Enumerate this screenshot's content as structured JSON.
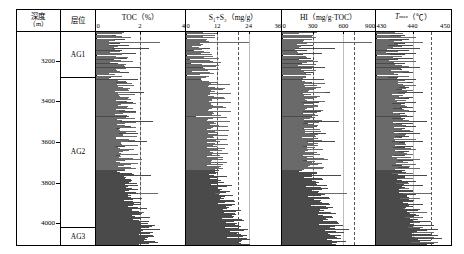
{
  "figure": {
    "title_visible": false,
    "depth_header": {
      "line1": "深度",
      "line2": "（m）"
    },
    "strata_header": "层位",
    "depth_axis": {
      "label_unit": "m",
      "min": 3060,
      "max": 4110,
      "ticks": [
        3200,
        3400,
        3600,
        3800,
        4000
      ],
      "tick_labels": [
        "3200",
        "3400",
        "3600",
        "3800",
        "4000"
      ]
    },
    "strata": [
      {
        "name": "AG1",
        "top": 3060,
        "base": 3280
      },
      {
        "name": "AG2",
        "top": 3280,
        "base": 4018
      },
      {
        "name": "AG3",
        "top": 4018,
        "base": 4110
      }
    ]
  },
  "chart_data": {
    "type": "bar",
    "orientation": "horizontal-spike-log",
    "title": "",
    "ylabel": "深度（m）",
    "ylim": [
      4110,
      3060
    ],
    "grid": false,
    "legend": "none",
    "tracks": [
      {
        "name": "toc",
        "title": "TOC（%）",
        "unit": "%",
        "xlabel": "TOC（%）",
        "xlim": [
          0,
          4
        ],
        "ticks": [
          0,
          2,
          4
        ],
        "tick_labels": [
          "0",
          "2",
          "4"
        ],
        "reference_lines": [
          2.0
        ],
        "depths": [
          3075,
          3085,
          3092,
          3100,
          3108,
          3115,
          3122,
          3130,
          3138,
          3146,
          3154,
          3162,
          3170,
          3178,
          3186,
          3194,
          3202,
          3210,
          3218,
          3226,
          3234,
          3242,
          3250,
          3258,
          3266,
          3274,
          3282,
          3290,
          3298,
          3306,
          3314,
          3322,
          3330,
          3338,
          3346,
          3354,
          3362,
          3370,
          3378,
          3386,
          3394,
          3402,
          3410,
          3418,
          3426,
          3434,
          3442,
          3450,
          3458,
          3466,
          3474,
          3482,
          3490,
          3498,
          3506,
          3514,
          3522,
          3530,
          3538,
          3546,
          3554,
          3562,
          3570,
          3578,
          3586,
          3594,
          3602,
          3610,
          3618,
          3626,
          3634,
          3642,
          3650,
          3658,
          3666,
          3674,
          3682,
          3690,
          3698,
          3706,
          3714,
          3722,
          3730,
          3738,
          3746,
          3754,
          3762,
          3770,
          3778,
          3786,
          3794,
          3802,
          3810,
          3818,
          3826,
          3834,
          3842,
          3850,
          3858,
          3866,
          3874,
          3882,
          3890,
          3898,
          3906,
          3914,
          3922,
          3930,
          3938,
          3946,
          3954,
          3962,
          3970,
          3978,
          3986,
          3994,
          4002,
          4010,
          4018,
          4026,
          4034,
          4042,
          4050,
          4058,
          4066,
          4074,
          4082,
          4090,
          4098
        ],
        "values": [
          0.9,
          1.6,
          1.3,
          0.8,
          2.9,
          1.1,
          1.5,
          1.0,
          2.4,
          1.2,
          0.7,
          1.8,
          1.1,
          0.9,
          1.4,
          0.8,
          1.7,
          1.0,
          0.6,
          1.3,
          2.0,
          0.9,
          1.1,
          1.5,
          0.8,
          1.2,
          0.7,
          1.9,
          1.0,
          1.4,
          0.9,
          1.6,
          1.1,
          0.8,
          1.3,
          2.2,
          1.0,
          0.9,
          1.5,
          1.2,
          0.8,
          1.7,
          1.1,
          1.0,
          1.4,
          0.9,
          1.3,
          1.8,
          1.1,
          0.8,
          1.5,
          1.0,
          1.2,
          2.6,
          1.3,
          0.9,
          1.6,
          1.1,
          0.8,
          1.4,
          1.9,
          1.0,
          1.2,
          0.9,
          1.5,
          2.3,
          1.1,
          0.8,
          1.3,
          1.0,
          1.7,
          1.2,
          0.9,
          1.4,
          1.1,
          0.8,
          2.1,
          1.3,
          1.0,
          1.6,
          0.9,
          1.2,
          1.8,
          1.1,
          0.8,
          1.4,
          2.5,
          1.0,
          1.3,
          0.9,
          1.6,
          1.1,
          1.9,
          0.8,
          1.2,
          1.5,
          1.0,
          2.8,
          1.3,
          0.9,
          1.7,
          1.1,
          1.4,
          0.8,
          2.0,
          1.2,
          1.0,
          1.6,
          0.9,
          2.2,
          1.3,
          1.1,
          1.8,
          1.0,
          2.4,
          1.4,
          1.2,
          2.7,
          1.5,
          2.9,
          1.6,
          2.3,
          1.7,
          2.6,
          1.8,
          2.1,
          1.5,
          2.0,
          1.4
        ]
      },
      {
        "name": "s1_s2",
        "title": "S₁+S₂（mg/g）",
        "unit": "mg/g",
        "xlabel": "S₁+S₂（mg/g）",
        "xlim": [
          0,
          36
        ],
        "ticks": [
          0,
          12,
          24,
          36
        ],
        "tick_labels": [
          "0",
          "12",
          "24",
          "36"
        ],
        "reference_lines": [
          12,
          20
        ],
        "depths": [
          3075,
          3085,
          3092,
          3100,
          3108,
          3115,
          3122,
          3130,
          3138,
          3146,
          3154,
          3162,
          3170,
          3178,
          3186,
          3194,
          3202,
          3210,
          3218,
          3226,
          3234,
          3242,
          3250,
          3258,
          3266,
          3274,
          3282,
          3290,
          3298,
          3306,
          3314,
          3322,
          3330,
          3338,
          3346,
          3354,
          3362,
          3370,
          3378,
          3386,
          3394,
          3402,
          3410,
          3418,
          3426,
          3434,
          3442,
          3450,
          3458,
          3466,
          3474,
          3482,
          3490,
          3498,
          3506,
          3514,
          3522,
          3530,
          3538,
          3546,
          3554,
          3562,
          3570,
          3578,
          3586,
          3594,
          3602,
          3610,
          3618,
          3626,
          3634,
          3642,
          3650,
          3658,
          3666,
          3674,
          3682,
          3690,
          3698,
          3706,
          3714,
          3722,
          3730,
          3738,
          3746,
          3754,
          3762,
          3770,
          3778,
          3786,
          3794,
          3802,
          3810,
          3818,
          3826,
          3834,
          3842,
          3850,
          3858,
          3866,
          3874,
          3882,
          3890,
          3898,
          3906,
          3914,
          3922,
          3930,
          3938,
          3946,
          3954,
          3962,
          3970,
          3978,
          3986,
          3994,
          4002,
          4010,
          4018,
          4026,
          4034,
          4042,
          4050,
          4058,
          4066,
          4074,
          4082,
          4090,
          4098
        ],
        "values": [
          2.5,
          6.0,
          3.2,
          1.8,
          24.0,
          2.6,
          4.0,
          2.2,
          9.0,
          3.0,
          1.5,
          5.5,
          2.4,
          1.9,
          3.6,
          1.7,
          4.8,
          2.1,
          1.3,
          3.1,
          6.5,
          1.9,
          2.4,
          4.2,
          1.7,
          2.8,
          1.5,
          5.9,
          2.2,
          3.8,
          1.9,
          4.6,
          2.5,
          1.6,
          3.3,
          8.0,
          2.1,
          1.8,
          4.1,
          2.9,
          1.6,
          5.0,
          2.4,
          2.0,
          3.5,
          1.8,
          3.0,
          5.6,
          2.3,
          1.6,
          4.0,
          2.1,
          2.7,
          11.0,
          3.2,
          1.9,
          4.7,
          2.4,
          1.7,
          3.6,
          6.2,
          2.0,
          2.8,
          1.8,
          4.2,
          9.5,
          2.3,
          1.6,
          3.1,
          2.0,
          5.1,
          2.7,
          1.8,
          3.7,
          2.3,
          1.6,
          7.4,
          3.0,
          2.1,
          4.9,
          1.8,
          2.6,
          5.8,
          2.2,
          1.6,
          3.4,
          10.5,
          2.0,
          3.0,
          1.8,
          4.6,
          2.3,
          6.8,
          1.6,
          2.7,
          3.9,
          2.0,
          13.0,
          3.1,
          1.8,
          5.2,
          2.2,
          3.5,
          1.6,
          6.4,
          2.6,
          2.0,
          4.8,
          1.7,
          7.8,
          3.2,
          2.3,
          5.6,
          2.0,
          9.2,
          3.4,
          2.6,
          10.8,
          3.8,
          12.5,
          4.0,
          8.5,
          4.4,
          11.5,
          4.8,
          7.0,
          3.6,
          6.0,
          3.2
        ]
      },
      {
        "name": "hi",
        "title": "HI（mg/g·TOC）",
        "unit": "mg/g·TOC",
        "xlabel": "HI（mg/g·TOC）",
        "xlim": [
          0,
          900
        ],
        "ticks": [
          0,
          300,
          600,
          900
        ],
        "tick_labels": [
          "0",
          "300",
          "600",
          "900"
        ],
        "reference_lines": [
          300,
          700
        ],
        "depths": [
          3075,
          3085,
          3092,
          3100,
          3108,
          3115,
          3122,
          3130,
          3138,
          3146,
          3154,
          3162,
          3170,
          3178,
          3186,
          3194,
          3202,
          3210,
          3218,
          3226,
          3234,
          3242,
          3250,
          3258,
          3266,
          3274,
          3282,
          3290,
          3298,
          3306,
          3314,
          3322,
          3330,
          3338,
          3346,
          3354,
          3362,
          3370,
          3378,
          3386,
          3394,
          3402,
          3410,
          3418,
          3426,
          3434,
          3442,
          3450,
          3458,
          3466,
          3474,
          3482,
          3490,
          3498,
          3506,
          3514,
          3522,
          3530,
          3538,
          3546,
          3554,
          3562,
          3570,
          3578,
          3586,
          3594,
          3602,
          3610,
          3618,
          3626,
          3634,
          3642,
          3650,
          3658,
          3666,
          3674,
          3682,
          3690,
          3698,
          3706,
          3714,
          3722,
          3730,
          3738,
          3746,
          3754,
          3762,
          3770,
          3778,
          3786,
          3794,
          3802,
          3810,
          3818,
          3826,
          3834,
          3842,
          3850,
          3858,
          3866,
          3874,
          3882,
          3890,
          3898,
          3906,
          3914,
          3922,
          3930,
          3938,
          3946,
          3954,
          3962,
          3970,
          3978,
          3986,
          3994,
          4002,
          4010,
          4018,
          4026,
          4034,
          4042,
          4050,
          4058,
          4066,
          4074,
          4082,
          4090,
          4098
        ],
        "values": [
          210,
          330,
          250,
          170,
          880,
          220,
          300,
          190,
          520,
          240,
          150,
          390,
          205,
          180,
          280,
          165,
          350,
          195,
          135,
          245,
          420,
          185,
          215,
          305,
          170,
          230,
          150,
          410,
          200,
          290,
          185,
          340,
          220,
          160,
          260,
          470,
          195,
          175,
          300,
          235,
          160,
          360,
          210,
          190,
          270,
          175,
          240,
          385,
          205,
          160,
          295,
          190,
          225,
          560,
          250,
          180,
          345,
          215,
          165,
          275,
          430,
          190,
          230,
          175,
          310,
          520,
          205,
          160,
          245,
          185,
          370,
          225,
          170,
          285,
          205,
          160,
          450,
          240,
          195,
          355,
          170,
          220,
          400,
          200,
          160,
          265,
          580,
          185,
          235,
          170,
          330,
          205,
          440,
          160,
          225,
          290,
          190,
          640,
          250,
          175,
          375,
          200,
          270,
          160,
          430,
          215,
          185,
          350,
          165,
          480,
          255,
          195,
          390,
          180,
          540,
          265,
          205,
          600,
          280,
          660,
          290,
          520,
          300,
          580,
          310,
          470,
          270,
          420,
          250
        ]
      },
      {
        "name": "tmax",
        "title": "T_max（℃）",
        "title_plain": "Tmax（℃）",
        "unit": "℃",
        "xlabel": "Tmax（℃）",
        "xlim": [
          430,
          450
        ],
        "ticks": [
          430,
          440,
          450
        ],
        "tick_labels": [
          "430",
          "440",
          "450"
        ],
        "reference_lines": [
          445
        ],
        "depths": [
          3075,
          3085,
          3092,
          3100,
          3108,
          3115,
          3122,
          3130,
          3138,
          3146,
          3154,
          3162,
          3170,
          3178,
          3186,
          3194,
          3202,
          3210,
          3218,
          3226,
          3234,
          3242,
          3250,
          3258,
          3266,
          3274,
          3282,
          3290,
          3298,
          3306,
          3314,
          3322,
          3330,
          3338,
          3346,
          3354,
          3362,
          3370,
          3378,
          3386,
          3394,
          3402,
          3410,
          3418,
          3426,
          3434,
          3442,
          3450,
          3458,
          3466,
          3474,
          3482,
          3490,
          3498,
          3506,
          3514,
          3522,
          3530,
          3538,
          3546,
          3554,
          3562,
          3570,
          3578,
          3586,
          3594,
          3602,
          3610,
          3618,
          3626,
          3634,
          3642,
          3650,
          3658,
          3666,
          3674,
          3682,
          3690,
          3698,
          3706,
          3714,
          3722,
          3730,
          3738,
          3746,
          3754,
          3762,
          3770,
          3778,
          3786,
          3794,
          3802,
          3810,
          3818,
          3826,
          3834,
          3842,
          3850,
          3858,
          3866,
          3874,
          3882,
          3890,
          3898,
          3906,
          3914,
          3922,
          3930,
          3938,
          3946,
          3954,
          3962,
          3970,
          3978,
          3986,
          3994,
          4002,
          4010,
          4018,
          4026,
          4034,
          4042,
          4050,
          4058,
          4066,
          4074,
          4082,
          4090,
          4098
        ],
        "values": [
          438,
          441,
          439,
          437,
          443,
          438,
          440,
          437,
          442,
          439,
          436,
          441,
          438,
          437,
          440,
          436,
          441,
          438,
          435,
          439,
          442,
          437,
          439,
          440,
          436,
          439,
          436,
          441,
          438,
          440,
          437,
          441,
          439,
          437,
          440,
          443,
          438,
          437,
          440,
          439,
          436,
          441,
          438,
          438,
          440,
          437,
          439,
          441,
          438,
          437,
          440,
          438,
          439,
          444,
          440,
          437,
          441,
          438,
          437,
          440,
          442,
          438,
          439,
          437,
          441,
          443,
          438,
          437,
          440,
          438,
          441,
          439,
          437,
          440,
          438,
          437,
          442,
          440,
          438,
          441,
          437,
          439,
          442,
          438,
          437,
          440,
          444,
          438,
          440,
          437,
          441,
          439,
          443,
          437,
          439,
          440,
          438,
          445,
          441,
          437,
          442,
          439,
          440,
          437,
          443,
          440,
          438,
          442,
          437,
          444,
          441,
          439,
          443,
          438,
          445,
          442,
          440,
          446,
          443,
          447,
          444,
          446,
          445,
          447,
          446,
          448,
          445,
          447,
          446
        ]
      }
    ]
  }
}
